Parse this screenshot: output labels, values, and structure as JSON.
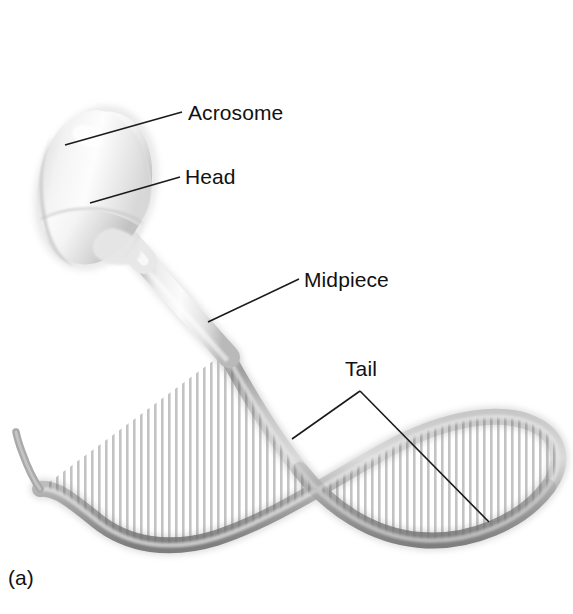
{
  "figure": {
    "caption": "(a)",
    "background_color": "#ffffff",
    "width": 573,
    "height": 614
  },
  "labels": [
    {
      "id": "acrosome",
      "text": "Acrosome",
      "leader_from": [
        65,
        145
      ],
      "leader_to": [
        182,
        112
      ]
    },
    {
      "id": "head",
      "text": "Head",
      "leader_from": [
        90,
        203
      ],
      "leader_to": [
        180,
        177
      ]
    },
    {
      "id": "midpiece",
      "text": "Midpiece",
      "leader_from": [
        208,
        322
      ],
      "leader_to": [
        299,
        279
      ]
    },
    {
      "id": "tail",
      "text": "Tail",
      "leader_vertex": [
        360,
        391
      ],
      "leader_branch_left": [
        292,
        439
      ],
      "leader_branch_right": [
        489,
        522
      ]
    }
  ],
  "colors": {
    "leader_line": "#1a1a1a",
    "label_text": "#111111",
    "head_light": "#fbfbfb",
    "head_mid": "#dedede",
    "head_shadow": "#b8b8b8",
    "midpiece_light": "#f2f2f2",
    "midpiece_mid": "#d2d2d2",
    "tail_light": "#c9c9c9",
    "tail_mid": "#9b9b9b",
    "tail_dark": "#7c7c7c"
  },
  "anatomy": {
    "parts": [
      {
        "name": "acrosome",
        "description": "cap covering the anterior head"
      },
      {
        "name": "head",
        "description": "ovoid nucleus-containing body"
      },
      {
        "name": "neck",
        "description": "short constricted junction"
      },
      {
        "name": "midpiece",
        "description": "segmented mitochondrial helix"
      },
      {
        "name": "tail",
        "description": "long looping flagellum"
      }
    ]
  }
}
